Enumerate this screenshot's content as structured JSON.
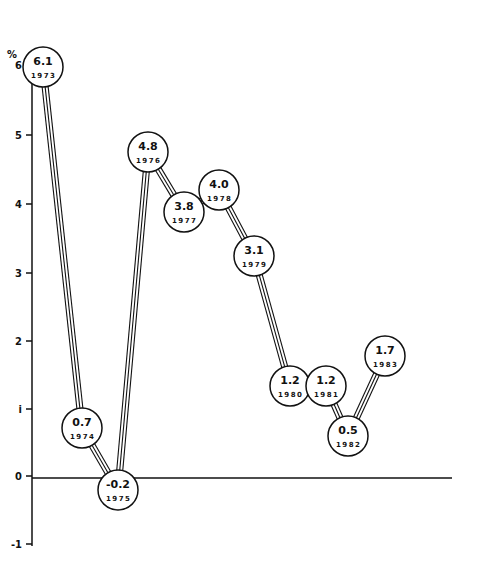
{
  "chart_data": {
    "type": "line",
    "title": "",
    "xlabel": "",
    "ylabel": "%",
    "ylim": [
      -1,
      6
    ],
    "y_ticks": [
      "6",
      "5",
      "4",
      "3",
      "2",
      "i",
      "0",
      "-1"
    ],
    "y_tick_values": [
      6,
      5,
      4,
      3,
      2,
      1,
      0,
      -1
    ],
    "grid": false,
    "legend": null,
    "x": [
      "1973",
      "1974",
      "1975",
      "1976",
      "1977",
      "1978",
      "1979",
      "1980",
      "1981",
      "1982",
      "1983"
    ],
    "series": [
      {
        "name": "Annual % change",
        "values": [
          6.1,
          0.7,
          -0.2,
          4.8,
          3.8,
          4.0,
          3.1,
          1.2,
          1.2,
          0.5,
          1.7
        ],
        "labels": [
          "6.1",
          "0.7",
          "-0.2",
          "4.8",
          "3.8",
          "4.0",
          "3.1",
          "1.2",
          "1.2",
          "0.5",
          "1.7"
        ]
      }
    ],
    "points_px": [
      {
        "cx": 43,
        "cy": 67
      },
      {
        "cx": 82,
        "cy": 428
      },
      {
        "cx": 118,
        "cy": 490
      },
      {
        "cx": 148,
        "cy": 152
      },
      {
        "cx": 184,
        "cy": 212
      },
      {
        "cx": 219,
        "cy": 190
      },
      {
        "cx": 254,
        "cy": 256
      },
      {
        "cx": 290,
        "cy": 386
      },
      {
        "cx": 326,
        "cy": 386
      },
      {
        "cx": 348,
        "cy": 436
      },
      {
        "cx": 385,
        "cy": 356
      }
    ]
  },
  "axis": {
    "unit_label": "%",
    "tick_px": [
      65,
      135,
      204,
      273,
      341,
      409,
      476,
      544
    ]
  }
}
